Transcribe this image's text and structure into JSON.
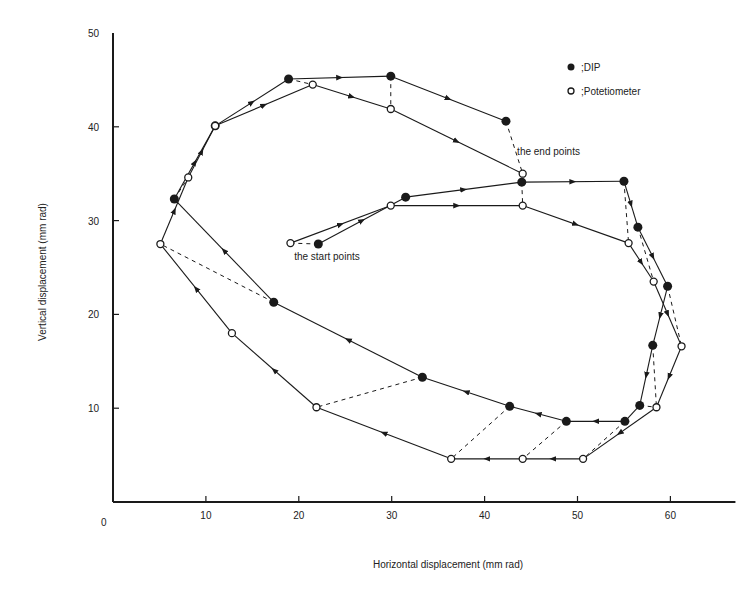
{
  "chart_data": {
    "type": "line",
    "title": "",
    "xlabel": "Horizontal displacement (mm rad)",
    "ylabel": "Vertical displacement (mm rad)",
    "xlim": [
      0,
      67
    ],
    "ylim": [
      0,
      50
    ],
    "xticks": [
      0,
      10,
      20,
      30,
      40,
      50,
      60
    ],
    "yticks": [
      10,
      20,
      30,
      40,
      50
    ],
    "origin_label": "0",
    "grid": false,
    "legend_position": "upper right",
    "series": [
      {
        "name": ";DIP",
        "marker": "filled-circle",
        "points": [
          [
            22.1,
            27.5
          ],
          [
            31.5,
            32.5
          ],
          [
            44.0,
            34.1
          ],
          [
            55.0,
            34.2
          ],
          [
            56.5,
            29.3
          ],
          [
            59.7,
            23.0
          ],
          [
            58.1,
            16.7
          ],
          [
            56.7,
            10.3
          ],
          [
            55.1,
            8.6
          ],
          [
            48.8,
            8.6
          ],
          [
            42.7,
            10.2
          ],
          [
            33.3,
            13.3
          ],
          [
            17.3,
            21.3
          ],
          [
            6.6,
            32.3
          ],
          [
            11.0,
            40.1
          ],
          [
            18.9,
            45.1
          ],
          [
            29.9,
            45.4
          ],
          [
            42.3,
            40.6
          ]
        ]
      },
      {
        "name": ";Potetiometer",
        "marker": "open-circle",
        "points": [
          [
            19.1,
            27.6
          ],
          [
            29.9,
            31.6
          ],
          [
            44.1,
            31.6
          ],
          [
            55.5,
            27.6
          ],
          [
            58.2,
            23.5
          ],
          [
            61.2,
            16.6
          ],
          [
            58.5,
            10.1
          ],
          [
            50.6,
            4.6
          ],
          [
            44.1,
            4.6
          ],
          [
            36.4,
            4.6
          ],
          [
            21.9,
            10.1
          ],
          [
            12.8,
            18.0
          ],
          [
            5.1,
            27.5
          ],
          [
            8.1,
            34.6
          ],
          [
            11.0,
            40.1
          ],
          [
            21.5,
            44.5
          ],
          [
            29.9,
            41.9
          ],
          [
            44.1,
            35.0
          ]
        ]
      }
    ],
    "correspondence_links": [
      [
        0,
        0
      ],
      [
        2,
        2
      ],
      [
        3,
        3
      ],
      [
        4,
        4
      ],
      [
        5,
        5
      ],
      [
        6,
        6
      ],
      [
        7,
        6
      ],
      [
        8,
        7
      ],
      [
        9,
        8
      ],
      [
        10,
        9
      ],
      [
        11,
        10
      ],
      [
        12,
        12
      ],
      [
        13,
        13
      ],
      [
        16,
        16
      ],
      [
        17,
        17
      ],
      [
        15,
        15
      ]
    ],
    "annotations": [
      {
        "text": "the start points",
        "x": 19.5,
        "y": 25.8
      },
      {
        "text": "the end points",
        "x": 43.5,
        "y": 37.0
      }
    ]
  },
  "legend": {
    "dip_label": ";DIP",
    "pot_label": ";Potetiometer"
  },
  "labels": {
    "xlabel": "Horizontal displacement (mm rad)",
    "ylabel": "Vertical displacement (mm rad)",
    "start": "the start points",
    "end": "the end points",
    "origin": "0"
  },
  "colors": {
    "ink": "#1a1a1a",
    "background": "#ffffff"
  }
}
